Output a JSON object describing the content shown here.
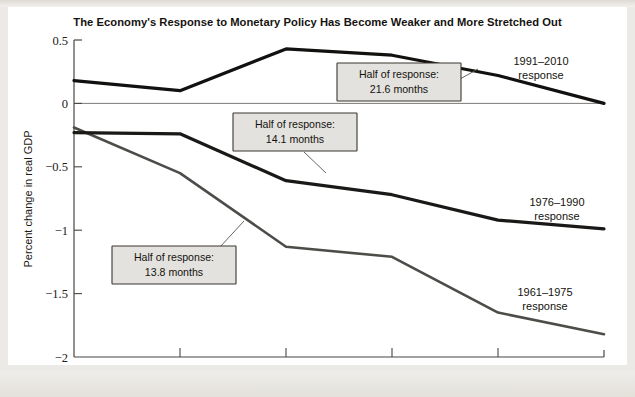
{
  "chart_data": {
    "type": "line",
    "title": "The Economy's Response to Monetary Policy Has Become Weaker and More Stretched Out",
    "xlabel": "Months",
    "ylabel": "Percent change in real GDP",
    "x": [
      9,
      12,
      15,
      18,
      21,
      24
    ],
    "xticklabels": [
      "9",
      "12",
      "15",
      "18",
      "21",
      "24"
    ],
    "yticks": [
      0.5,
      0,
      -0.5,
      -1,
      -1.5,
      -2
    ],
    "yticklabels": [
      "0.5",
      "0",
      "−0.5",
      "−1",
      "−1.5",
      "−2"
    ],
    "xlim": [
      9,
      24
    ],
    "ylim": [
      -2,
      0.5
    ],
    "grid": false,
    "legend_position": "inline-right-of-line-ends",
    "series": [
      {
        "name": "1991–2010 response",
        "color": "#121110",
        "width": 3.2,
        "values": [
          0.18,
          0.1,
          0.43,
          0.38,
          0.22,
          0.0
        ]
      },
      {
        "name": "1976–1990 response",
        "color": "#1a1917",
        "width": 3.2,
        "values": [
          -0.23,
          -0.24,
          -0.61,
          -0.72,
          -0.92,
          -0.99
        ]
      },
      {
        "name": "1961–1975 response",
        "color": "#4e4c48",
        "width": 2.6,
        "values": [
          -0.19,
          -0.55,
          -1.13,
          -1.21,
          -1.65,
          -1.82
        ]
      }
    ],
    "annotations": [
      {
        "id": "callout-1991-2010",
        "line1": "Half of response:",
        "line2": "21.6 months",
        "value_months": 21.6,
        "refers_to": "1991–2010 response"
      },
      {
        "id": "callout-1976-1990",
        "line1": "Half of response:",
        "line2": "14.1 months",
        "value_months": 14.1,
        "refers_to": "1976–1990 response"
      },
      {
        "id": "callout-1961-1975",
        "line1": "Half of response:",
        "line2": "13.8 months",
        "value_months": 13.8,
        "refers_to": "1961–1975 response"
      }
    ]
  },
  "labels": {
    "series_1991": {
      "line1": "1991–2010",
      "line2": "response"
    },
    "series_1976": {
      "line1": "1976–1990",
      "line2": "response"
    },
    "series_1961": {
      "line1": "1961–1975",
      "line2": "response"
    }
  },
  "ticks": {
    "y": {
      "t0": "0.5",
      "t1": "0",
      "t2": "−0.5",
      "t3": "−1",
      "t4": "−1.5",
      "t5": "−2"
    },
    "x": {
      "t0": "9",
      "t1": "12",
      "t2": "15",
      "t3": "18",
      "t4": "21",
      "t5": "24"
    }
  },
  "axis": {
    "x_title": "Months",
    "y_title": "Percent change in real GDP"
  },
  "callouts": {
    "c1": {
      "line1": "Half of response:",
      "line2": "21.6 months"
    },
    "c2": {
      "line1": "Half of response:",
      "line2": "14.1 months"
    },
    "c3": {
      "line1": "Half of response:",
      "line2": "13.8 months"
    }
  },
  "colors": {
    "series_1991": "#121110",
    "series_1976": "#1a1917",
    "series_1961": "#4e4c48",
    "axis": "#4a4742",
    "callout_fill": "#e4e2de",
    "paper": "#eceae6"
  }
}
